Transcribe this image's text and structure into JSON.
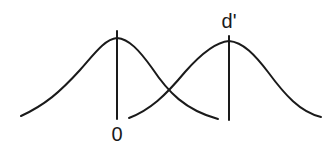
{
  "diagram": {
    "title": "",
    "distributions": [
      {
        "name": "noise",
        "mean_label": "0",
        "mean_x": 117
      },
      {
        "name": "signal",
        "mean_label": "d'",
        "mean_x": 229
      }
    ],
    "stroke_color": "#1a1a1a",
    "background": "#ffffff"
  }
}
